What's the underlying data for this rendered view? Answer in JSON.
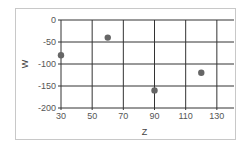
{
  "chart_data": {
    "type": "scatter",
    "title": "",
    "xlabel": "Z",
    "ylabel": "W",
    "xlim": [
      30,
      141
    ],
    "ylim": [
      -200,
      0
    ],
    "xticks": [
      30,
      50,
      70,
      90,
      110,
      130
    ],
    "yticks": [
      0,
      -50,
      -100,
      -150,
      -200
    ],
    "grid": true,
    "legend": null,
    "series": [
      {
        "name": "",
        "color": "#666666",
        "x": [
          30,
          60,
          90,
          120
        ],
        "y": [
          -80,
          -40,
          -160,
          -120
        ]
      }
    ]
  }
}
